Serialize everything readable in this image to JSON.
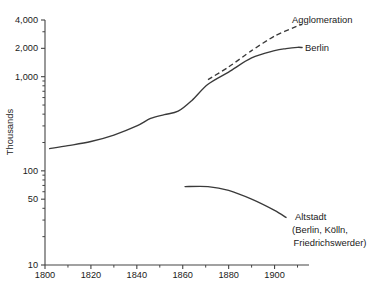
{
  "chart_data": {
    "type": "line",
    "title": "",
    "subtitle": "",
    "xlabel": "",
    "ylabel": "Thousands",
    "yscale": "log",
    "xscale": "linear",
    "xlim": [
      1800,
      1915
    ],
    "ylim": [
      10,
      4000
    ],
    "grid": false,
    "legend_position": "inline-annotations",
    "y_ticks_labeled": [
      {
        "value": 10,
        "label": "10"
      },
      {
        "value": 50,
        "label": "50"
      },
      {
        "value": 100,
        "label": "100"
      },
      {
        "value": 1000,
        "label": "1,000"
      },
      {
        "value": 2000,
        "label": "2,000"
      },
      {
        "value": 4000,
        "label": "4,000"
      }
    ],
    "y_ticks_minor": [
      20,
      30,
      40,
      60,
      70,
      80,
      90,
      200,
      300,
      400,
      500,
      600,
      700,
      800,
      900,
      3000
    ],
    "x_ticks_labeled": [
      {
        "value": 1800,
        "label": "1800"
      },
      {
        "value": 1820,
        "label": "1820"
      },
      {
        "value": 1840,
        "label": "1840"
      },
      {
        "value": 1860,
        "label": "1860"
      },
      {
        "value": 1880,
        "label": "1880"
      },
      {
        "value": 1900,
        "label": "1900"
      }
    ],
    "x_ticks_minor": [
      1810,
      1830,
      1850,
      1870,
      1890,
      1910
    ],
    "series": [
      {
        "name": "Berlin",
        "style": "solid",
        "label": "Berlin",
        "color": "#3a3a3a",
        "x": [
          1802,
          1810,
          1820,
          1830,
          1840,
          1846,
          1852,
          1858,
          1864,
          1871,
          1880,
          1890,
          1900,
          1905,
          1910,
          1912
        ],
        "values": [
          172,
          185,
          205,
          240,
          300,
          360,
          395,
          430,
          560,
          830,
          1120,
          1580,
          1890,
          1990,
          2050,
          2040
        ]
      },
      {
        "name": "Agglomeration",
        "style": "dashed",
        "label": "Agglomeration",
        "color": "#3a3a3a",
        "x": [
          1871,
          1880,
          1890,
          1900,
          1910,
          1912
        ],
        "values": [
          930,
          1270,
          1890,
          2700,
          3450,
          3580
        ]
      },
      {
        "name": "Altstadt",
        "style": "solid",
        "label": "Altstadt",
        "label_line2": "(Berlin, Kölln,",
        "label_line3": "Friedrichswerder)",
        "color": "#3a3a3a",
        "x": [
          1861,
          1871,
          1880,
          1890,
          1900,
          1905
        ],
        "values": [
          68,
          68,
          62,
          50,
          38,
          32
        ]
      }
    ],
    "annotations": [
      {
        "text": "Agglomeration",
        "anchor_x": 1915,
        "anchor_y": 3700
      },
      {
        "text": "Berlin",
        "anchor_x": 1915,
        "anchor_y": 2050
      },
      {
        "text": "Altstadt",
        "anchor_x": 1908,
        "anchor_y": 33
      },
      {
        "text": "(Berlin, Kölln,",
        "anchor_x": 1908,
        "anchor_y": 26
      },
      {
        "text": "Friedrichswerder)",
        "anchor_x": 1908,
        "anchor_y": 21
      }
    ]
  },
  "axis": {
    "y_title": "Thousands"
  },
  "labels": {
    "agglomeration": "Agglomeration",
    "berlin": "Berlin",
    "altstadt_l1": "Altstadt",
    "altstadt_l2": "(Berlin, Kölln,",
    "altstadt_l3": "Friedrichswerder)"
  },
  "ytick_labels": {
    "t4000": "4,000",
    "t2000": "2,000",
    "t1000": "1,000",
    "t100": "100",
    "t50": "50",
    "t10": "10"
  },
  "xtick_labels": {
    "t1800": "1800",
    "t1820": "1820",
    "t1840": "1840",
    "t1860": "1860",
    "t1880": "1880",
    "t1900": "1900"
  },
  "colors": {
    "background": "#ffffff",
    "ink": "#3a3a3a",
    "axis": "#444444",
    "text": "#1a1a1a"
  }
}
